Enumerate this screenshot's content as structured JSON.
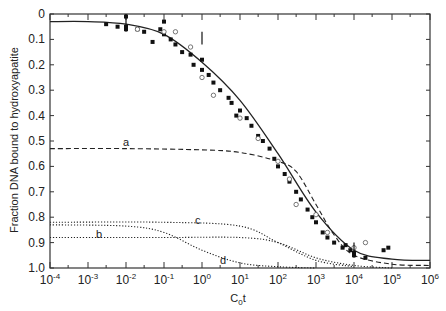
{
  "chart_data": {
    "type": "scatter",
    "title": "",
    "xlabel": "C0t",
    "ylabel": "Fraction DNA bound to hydroxyapatite",
    "xscale": "log",
    "xlim": [
      0.0001,
      1000000
    ],
    "ylim": [
      1.0,
      0
    ],
    "y_inverted": true,
    "x_ticks": [
      "10^-4",
      "10^-3",
      "10^-2",
      "10^-1",
      "10^0",
      "10^1",
      "10^2",
      "10^3",
      "10^4",
      "10^5",
      "10^6"
    ],
    "y_ticks": [
      "0",
      "0.1",
      "0.2",
      "0.3",
      "0.4",
      "0.5",
      "0.6",
      "0.7",
      "0.8",
      "0.9",
      "1.0"
    ],
    "grid": false,
    "series": [
      {
        "name": "fitted curve (solid)",
        "style": "solid",
        "x": [
          0.0001,
          0.001,
          0.01,
          0.1,
          1,
          10,
          100,
          1000,
          10000,
          100000,
          1000000
        ],
        "y": [
          0.03,
          0.03,
          0.04,
          0.08,
          0.19,
          0.34,
          0.55,
          0.78,
          0.93,
          0.965,
          0.97
        ]
      },
      {
        "name": "a",
        "style": "dashed",
        "x": [
          0.0001,
          0.01,
          1,
          10,
          100,
          300,
          1000,
          3000,
          10000,
          100000,
          1000000
        ],
        "y": [
          0.53,
          0.53,
          0.535,
          0.545,
          0.58,
          0.62,
          0.75,
          0.87,
          0.95,
          0.985,
          0.99
        ]
      },
      {
        "name": "b",
        "style": "dotted",
        "x": [
          0.0001,
          0.1,
          10,
          100,
          1000,
          10000,
          100000
        ],
        "y": [
          0.88,
          0.88,
          0.88,
          0.9,
          0.96,
          0.99,
          1.0
        ]
      },
      {
        "name": "c",
        "style": "dotted",
        "x": [
          0.0001,
          0.1,
          10,
          100,
          1000,
          10000
        ],
        "y": [
          0.82,
          0.82,
          0.835,
          0.9,
          0.97,
          0.995
        ]
      },
      {
        "name": "d",
        "style": "dotted",
        "x": [
          0.0001,
          0.01,
          0.1,
          1,
          10,
          100,
          1000
        ],
        "y": [
          0.83,
          0.835,
          0.86,
          0.93,
          0.98,
          0.995,
          1.0
        ]
      },
      {
        "name": "filled points",
        "style": "marker-filled",
        "x": [
          0.003,
          0.006,
          0.01,
          0.01,
          0.01,
          0.02,
          0.03,
          0.05,
          0.08,
          0.1,
          0.1,
          0.15,
          0.2,
          0.3,
          0.5,
          0.6,
          1,
          1,
          1.5,
          2,
          3,
          5,
          6,
          8,
          10,
          15,
          20,
          30,
          40,
          60,
          80,
          100,
          150,
          200,
          300,
          400,
          600,
          800,
          1000,
          1500,
          2000,
          3000,
          5000,
          6000,
          8000,
          10000,
          10000,
          20000,
          60000,
          80000
        ],
        "y": [
          0.04,
          0.05,
          0.01,
          0.05,
          0.06,
          0.06,
          0.07,
          0.11,
          0.06,
          0.03,
          0.08,
          0.1,
          0.12,
          0.15,
          0.16,
          0.2,
          0.18,
          0.22,
          0.24,
          0.27,
          0.3,
          0.33,
          0.35,
          0.4,
          0.38,
          0.41,
          0.44,
          0.48,
          0.5,
          0.53,
          0.57,
          0.6,
          0.63,
          0.66,
          0.7,
          0.73,
          0.77,
          0.8,
          0.82,
          0.86,
          0.88,
          0.9,
          0.92,
          0.91,
          0.93,
          0.94,
          0.95,
          0.96,
          0.93,
          0.92
        ]
      },
      {
        "name": "open points",
        "style": "marker-open",
        "x": [
          0.02,
          0.1,
          0.2,
          0.5,
          1,
          2,
          10,
          30,
          100,
          200,
          300,
          1000,
          2000,
          10000,
          20000
        ],
        "y": [
          0.06,
          0.07,
          0.07,
          0.13,
          0.25,
          0.32,
          0.41,
          0.49,
          0.58,
          0.65,
          0.75,
          0.79,
          0.86,
          0.92,
          0.9
        ]
      }
    ],
    "annotations": [
      {
        "text": "a",
        "x": 0.01,
        "y": 0.51
      },
      {
        "text": "b",
        "x": 0.01,
        "y": 0.86
      },
      {
        "text": "c",
        "x": 8,
        "y": 0.81
      },
      {
        "text": "d",
        "x": 10,
        "y": 0.97
      }
    ]
  },
  "labels": {
    "ylabel": "Fraction DNA bound to hydroxyapatite",
    "xlabel_main": "C",
    "xlabel_sub": "0",
    "xlabel_tail": "t",
    "a": "a",
    "b": "b",
    "c": "c",
    "d": "d"
  },
  "y_tick_labels": [
    "0",
    "0.1",
    "0.2",
    "0.3",
    "0.4",
    "0.5",
    "0.6",
    "0.7",
    "0.8",
    "0.9",
    "1.0"
  ],
  "x_tick_exponents": [
    "-4",
    "-3",
    "-2",
    "-1",
    "0",
    "1",
    "2",
    "3",
    "4",
    "5",
    "6"
  ]
}
